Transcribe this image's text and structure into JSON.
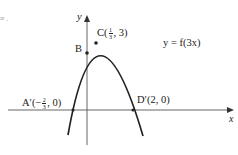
{
  "figure": {
    "function_label": "y = f(3x)",
    "x_axis_label": "x",
    "y_axis_label": "y",
    "edge_fragment": "≡ .",
    "points": [
      {
        "name": "C",
        "label_prefix": "C(",
        "frac_num": "1",
        "frac_den": "3",
        "label_suffix": ", 3)",
        "x": 0.3333,
        "y": 3
      },
      {
        "name": "B",
        "label": "B"
      },
      {
        "name": "A'",
        "label_prefix": "A′(−",
        "frac_num": "2",
        "frac_den": "3",
        "label_suffix": ", 0)",
        "x": -0.6667,
        "y": 0
      },
      {
        "name": "D'",
        "label": "D′(2, 0)",
        "x": 2,
        "y": 0
      }
    ]
  },
  "colors": {
    "curve": "#222222",
    "axis": "#555555",
    "text": "#222222"
  }
}
